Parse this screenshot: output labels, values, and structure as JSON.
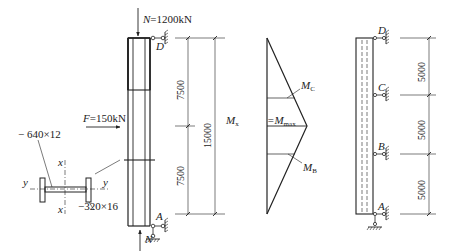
{
  "column_elevation": {
    "top_load": {
      "symbol": "N",
      "value": "=1200kN"
    },
    "bottom_load": {
      "symbol": "N"
    },
    "lateral_load": {
      "symbol": "F",
      "value": "=150kN"
    },
    "top_support": "D",
    "bottom_support": "A",
    "dimensions": {
      "upper": "7500",
      "lower": "7500",
      "total": "15000"
    }
  },
  "cross_section": {
    "web_plate": "− 640×12",
    "flange_plate": "−320×16",
    "axis_x_top": "x",
    "axis_x_bottom": "x",
    "axis_y_left": "y",
    "axis_y_right": "y"
  },
  "moment_diagram": {
    "mx_label": "M",
    "mx_sub": "x",
    "mmax_label": "=M",
    "mmax_sub": "max",
    "mc_label": "M",
    "mc_sub": "C",
    "mb_label": "M",
    "mb_sub": "B"
  },
  "braced_elevation": {
    "supports": [
      "D",
      "C",
      "B",
      "A"
    ],
    "dimensions": [
      "5000",
      "5000",
      "5000"
    ]
  }
}
